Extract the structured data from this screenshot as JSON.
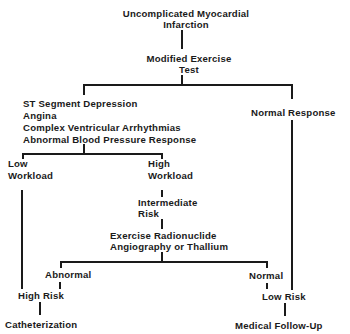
{
  "diagram": {
    "root": {
      "line1": "Uncomplicated Myocardial",
      "line2": "Infarction"
    },
    "test": {
      "line1": "Modified Exercise",
      "line2": "Test"
    },
    "abnormal_findings": [
      "ST Segment Depression",
      "Angina",
      "Complex Ventricular Arrhythmias",
      "Abnormal Blood Pressure Response"
    ],
    "normal_response": "Normal Response",
    "low_workload": {
      "line1": "Low",
      "line2": "Workload"
    },
    "high_workload": {
      "line1": "High",
      "line2": "Workload"
    },
    "intermediate_risk": {
      "line1": "Intermediate",
      "line2": "Risk"
    },
    "imaging": {
      "line1": "Exercise Radionuclide",
      "line2": "Angiography or Thallium"
    },
    "imaging_abnormal": "Abnormal",
    "imaging_normal": "Normal",
    "high_risk": "High Risk",
    "low_risk": "Low Risk",
    "catheterization": "Catheterization",
    "medical_follow_up": "Medical Follow-Up"
  }
}
